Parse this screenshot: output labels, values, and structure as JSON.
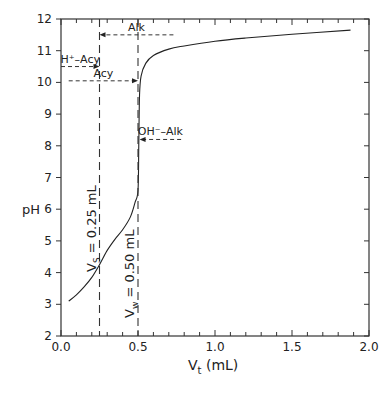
{
  "chart_data": {
    "type": "line",
    "title": "",
    "xlabel": "V_t (mL)",
    "xlabel_main": "V",
    "xlabel_sub": "t",
    "xlabel_unit": "(mL)",
    "ylabel": "pH",
    "xlim": [
      0.0,
      2.0
    ],
    "ylim": [
      2,
      12
    ],
    "x_ticks": [
      "0.0",
      "0.5",
      "1.0",
      "1.5",
      "2.0"
    ],
    "y_ticks": [
      "2",
      "3",
      "4",
      "5",
      "6",
      "7",
      "8",
      "9",
      "10",
      "11",
      "12"
    ],
    "grid": false,
    "series": [
      {
        "name": "titration curve",
        "x": [
          0.05,
          0.1,
          0.15,
          0.2,
          0.25,
          0.3,
          0.35,
          0.4,
          0.45,
          0.48,
          0.5,
          0.505,
          0.51,
          0.52,
          0.55,
          0.6,
          0.7,
          0.8,
          1.0,
          1.2,
          1.5,
          1.88
        ],
        "y": [
          3.1,
          3.3,
          3.55,
          3.85,
          4.25,
          4.7,
          5.05,
          5.35,
          5.75,
          6.2,
          6.6,
          8.0,
          9.6,
          10.2,
          10.6,
          10.85,
          11.05,
          11.15,
          11.3,
          11.4,
          11.52,
          11.65
        ]
      }
    ],
    "vertical_lines": [
      {
        "x": 0.25,
        "label_main": "V",
        "label_sub": "S",
        "label_rest": " = 0.25 mL"
      },
      {
        "x": 0.5,
        "label_main": "V",
        "label_sub": "w",
        "label_rest": " = 0.50 mL"
      }
    ],
    "annotations": [
      {
        "text": "Alk",
        "arrow_from_x": 0.73,
        "arrow_to_x": 0.25,
        "y": 11.5
      },
      {
        "text": "H⁺–Acy",
        "arrow_from_x": 0.0,
        "arrow_to_x": 0.25,
        "y": 10.5
      },
      {
        "text": "Acy",
        "arrow_from_x": 0.05,
        "arrow_to_x": 0.5,
        "y": 10.05
      },
      {
        "text": "OH⁻–Alk",
        "arrow_from_x": 0.78,
        "arrow_to_x": 0.51,
        "y": 8.2
      }
    ]
  }
}
